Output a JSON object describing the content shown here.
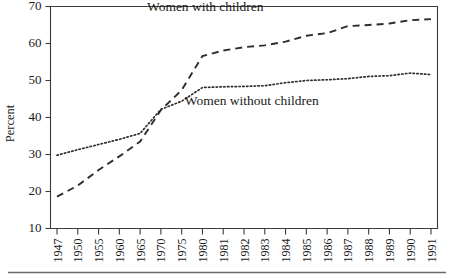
{
  "chart_data": {
    "type": "line",
    "title": "",
    "xlabel": "",
    "ylabel": "Percent",
    "ylim": [
      10,
      70
    ],
    "ytick_values": [
      10,
      20,
      30,
      40,
      50,
      60,
      70
    ],
    "ytick_labels": [
      "10",
      "20",
      "30",
      "40",
      "50",
      "60",
      "70"
    ],
    "grid": false,
    "legend_position": "inline-annotation",
    "categories": [
      "1947",
      "1950",
      "1955",
      "1960",
      "1965",
      "1970",
      "1975",
      "1980",
      "1981",
      "1982",
      "1983",
      "1984",
      "1985",
      "1986",
      "1987",
      "1988",
      "1989",
      "1990",
      "1991"
    ],
    "series": [
      {
        "name": "Women with children",
        "style": "dashed",
        "color": "#2e2e2e",
        "values": [
          18.6,
          21.6,
          25.8,
          29.5,
          33.5,
          42.0,
          47.4,
          56.6,
          58.1,
          59.0,
          59.5,
          60.5,
          62.1,
          62.8,
          64.7,
          65.0,
          65.4,
          66.3,
          66.6
        ]
      },
      {
        "name": "Women without children",
        "style": "dotted",
        "color": "#2e2e2e",
        "values": [
          29.8,
          31.3,
          32.7,
          34.1,
          35.7,
          42.2,
          44.4,
          48.1,
          48.3,
          48.4,
          48.6,
          49.4,
          50.0,
          50.2,
          50.5,
          51.1,
          51.3,
          52.0,
          51.6
        ]
      }
    ],
    "annotations": [
      {
        "text": "Women with children",
        "series": "Women with children",
        "x_frac": 0.4,
        "y_value": 68.8
      },
      {
        "text": "Women without children",
        "series": "Women without children",
        "x_frac": 0.52,
        "y_value": 43.3
      }
    ]
  }
}
